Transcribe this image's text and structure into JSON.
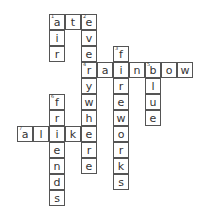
{
  "puzzle": {
    "cell_size": 16,
    "origin_x": 17,
    "origin_y": 14,
    "clues": [
      {
        "number": 1,
        "direction": "across",
        "answer": "ate",
        "row": 0,
        "col": 2
      },
      {
        "number": 1,
        "direction": "down",
        "answer": "air",
        "row": 0,
        "col": 2
      },
      {
        "number": 2,
        "direction": "down",
        "answer": "everywhere",
        "row": 0,
        "col": 4
      },
      {
        "number": 3,
        "direction": "down",
        "answer": "fireworks",
        "row": 2,
        "col": 6
      },
      {
        "number": 4,
        "direction": "across",
        "answer": "rainbow",
        "row": 3,
        "col": 4
      },
      {
        "number": 5,
        "direction": "down",
        "answer": "blue",
        "row": 3,
        "col": 8
      },
      {
        "number": 6,
        "direction": "down",
        "answer": "friends",
        "row": 5,
        "col": 2
      },
      {
        "number": 7,
        "direction": "across",
        "answer": "alike",
        "row": 7,
        "col": 0
      }
    ]
  }
}
